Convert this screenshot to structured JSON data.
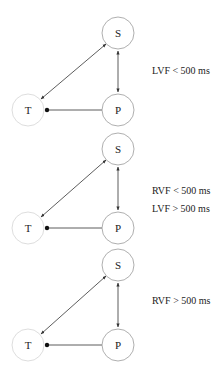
{
  "diagrams": [
    {
      "nodes": {
        "S": {
          "label": "S",
          "cx": 118,
          "cy": 33,
          "r": 16,
          "stroke": "#9a9a9a"
        },
        "P": {
          "label": "P",
          "cx": 118,
          "cy": 110,
          "r": 16,
          "stroke": "#9a9a9a"
        },
        "T": {
          "label": "T",
          "cx": 28,
          "cy": 110,
          "r": 16,
          "stroke": "#d4d4d4"
        }
      },
      "conditions": [
        "LVF < 500 ms"
      ]
    },
    {
      "nodes": {
        "S": {
          "label": "S",
          "cx": 118,
          "cy": 149,
          "r": 16,
          "stroke": "#9a9a9a"
        },
        "P": {
          "label": "P",
          "cx": 118,
          "cy": 228,
          "r": 16,
          "stroke": "#9a9a9a"
        },
        "T": {
          "label": "T",
          "cx": 28,
          "cy": 228,
          "r": 16,
          "stroke": "#d4d4d4"
        }
      },
      "conditions": [
        "RVF < 500 ms",
        "LVF > 500 ms"
      ]
    },
    {
      "nodes": {
        "S": {
          "label": "S",
          "cx": 118,
          "cy": 265,
          "r": 16,
          "stroke": "#9a9a9a"
        },
        "P": {
          "label": "P",
          "cx": 118,
          "cy": 345,
          "r": 16,
          "stroke": "#9a9a9a"
        },
        "T": {
          "label": "T",
          "cx": 28,
          "cy": 345,
          "r": 16,
          "stroke": "#d4d4d4"
        }
      },
      "conditions": [
        "RVF > 500 ms"
      ]
    }
  ],
  "edges": [
    {
      "from": "S",
      "to": "T",
      "type": "bidirectional-arrow"
    },
    {
      "from": "S",
      "to": "P",
      "type": "bidirectional-arrow"
    },
    {
      "from": "P",
      "to": "T",
      "type": "dot-terminated-line"
    }
  ],
  "colors": {
    "line": "#333333",
    "text": "#222222"
  }
}
